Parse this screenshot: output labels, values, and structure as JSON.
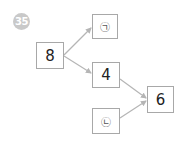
{
  "problem": {
    "number": "35",
    "badge_color": "#c9c9c9"
  },
  "diagram": {
    "boxes": [
      {
        "id": "start",
        "label": "8"
      },
      {
        "id": "blank_a",
        "label": "㉠"
      },
      {
        "id": "middle",
        "label": "4"
      },
      {
        "id": "blank_b",
        "label": "㉡"
      },
      {
        "id": "result",
        "label": "6"
      }
    ],
    "arrows": [
      {
        "from": "start",
        "to": "blank_a"
      },
      {
        "from": "start",
        "to": "middle"
      },
      {
        "from": "middle",
        "to": "result"
      },
      {
        "from": "blank_b",
        "to": "result"
      }
    ],
    "line_color": "#b5b5b5",
    "border_color": "#a8a8a8"
  }
}
